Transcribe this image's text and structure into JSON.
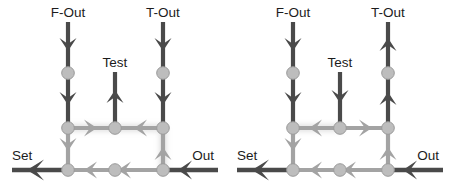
{
  "figure": {
    "title": "",
    "type": "diagram",
    "panel_count": 2,
    "canvas": {
      "width": 450,
      "height": 192
    },
    "background": "#ffffff"
  },
  "colors": {
    "dark_edge": "#4a4a4a",
    "light_edge": "#a3a3a3",
    "node_fill": "#bdbdbd",
    "node_stroke": "#9a9a9a",
    "label_text": "#1c1c1c",
    "glow": "#d8d8d8"
  },
  "labels": {
    "f_out": "F-Out",
    "t_out": "T-Out",
    "test": "Test",
    "set": "Set",
    "out": "Out"
  },
  "panels": [
    {
      "id": "left-panel",
      "name": "left-diagram",
      "ports": [
        {
          "name": "f-out-port",
          "label": "F-Out",
          "x": 68,
          "y": 18,
          "direction": "down"
        },
        {
          "name": "t-out-port",
          "label": "T-Out",
          "x": 163,
          "y": 18,
          "direction": "down"
        },
        {
          "name": "test-port",
          "label": "Test",
          "x": 115,
          "y": 68,
          "direction": "up"
        },
        {
          "name": "set-port",
          "label": "Set",
          "x": 12,
          "y": 170,
          "direction": "left"
        },
        {
          "name": "out-port",
          "label": "Out",
          "x": 213,
          "y": 170,
          "direction": "left"
        }
      ],
      "nodes": [
        {
          "name": "node-f-mid",
          "x": 68,
          "y": 73
        },
        {
          "name": "node-t-mid",
          "x": 163,
          "y": 73
        },
        {
          "name": "node-mid-left",
          "x": 68,
          "y": 128
        },
        {
          "name": "node-mid-center",
          "x": 115,
          "y": 128
        },
        {
          "name": "node-mid-right",
          "x": 163,
          "y": 128
        },
        {
          "name": "node-bot-left",
          "x": 68,
          "y": 170
        },
        {
          "name": "node-bot-center",
          "x": 115,
          "y": 170
        },
        {
          "name": "node-bot-right",
          "x": 163,
          "y": 170
        }
      ],
      "edges": [
        {
          "name": "edge-f-out-down",
          "direction": "down",
          "tone": "dark"
        },
        {
          "name": "edge-t-out-down",
          "direction": "down",
          "tone": "dark"
        },
        {
          "name": "edge-test-up",
          "direction": "up",
          "tone": "dark"
        },
        {
          "name": "edge-mid-left-to-center",
          "direction": "right",
          "tone": "light"
        },
        {
          "name": "edge-mid-right-to-center",
          "direction": "left",
          "tone": "light"
        },
        {
          "name": "edge-left-connector",
          "direction": "down",
          "tone": "light"
        },
        {
          "name": "edge-right-connector",
          "direction": "up",
          "tone": "light"
        },
        {
          "name": "edge-bottom-right-seg",
          "direction": "left",
          "tone": "light"
        },
        {
          "name": "edge-bottom-center-seg",
          "direction": "left",
          "tone": "light"
        },
        {
          "name": "edge-out-in",
          "direction": "left",
          "tone": "dark"
        },
        {
          "name": "edge-set-out",
          "direction": "left",
          "tone": "dark"
        }
      ]
    },
    {
      "id": "right-panel",
      "name": "right-diagram",
      "ports": [
        {
          "name": "f-out-port",
          "label": "F-Out",
          "x": 68,
          "y": 18,
          "direction": "down"
        },
        {
          "name": "t-out-port",
          "label": "T-Out",
          "x": 163,
          "y": 18,
          "direction": "up"
        },
        {
          "name": "test-port",
          "label": "Test",
          "x": 115,
          "y": 68,
          "direction": "down"
        },
        {
          "name": "set-port",
          "label": "Set",
          "x": 12,
          "y": 170,
          "direction": "left"
        },
        {
          "name": "out-port",
          "label": "Out",
          "x": 213,
          "y": 170,
          "direction": "left"
        }
      ],
      "nodes": [
        {
          "name": "node-f-mid",
          "x": 68,
          "y": 73
        },
        {
          "name": "node-t-mid",
          "x": 163,
          "y": 73
        },
        {
          "name": "node-mid-left",
          "x": 68,
          "y": 128
        },
        {
          "name": "node-mid-center",
          "x": 115,
          "y": 128
        },
        {
          "name": "node-mid-right",
          "x": 163,
          "y": 128
        },
        {
          "name": "node-bot-left",
          "x": 68,
          "y": 170
        },
        {
          "name": "node-bot-center",
          "x": 115,
          "y": 170
        },
        {
          "name": "node-bot-right",
          "x": 163,
          "y": 170
        }
      ],
      "edges": [
        {
          "name": "edge-f-out-down",
          "direction": "down",
          "tone": "dark"
        },
        {
          "name": "edge-t-out-up",
          "direction": "up",
          "tone": "dark"
        },
        {
          "name": "edge-test-down",
          "direction": "down",
          "tone": "dark"
        },
        {
          "name": "edge-mid-center-to-left",
          "direction": "left",
          "tone": "light"
        },
        {
          "name": "edge-mid-center-to-right",
          "direction": "right",
          "tone": "light"
        },
        {
          "name": "edge-left-connector",
          "direction": "down",
          "tone": "light"
        },
        {
          "name": "edge-right-connector",
          "direction": "up",
          "tone": "light"
        },
        {
          "name": "edge-bottom-right-seg",
          "direction": "left",
          "tone": "light"
        },
        {
          "name": "edge-bottom-center-seg",
          "direction": "left",
          "tone": "light"
        },
        {
          "name": "edge-out-in",
          "direction": "left",
          "tone": "dark"
        },
        {
          "name": "edge-set-out",
          "direction": "left",
          "tone": "dark"
        }
      ]
    }
  ]
}
